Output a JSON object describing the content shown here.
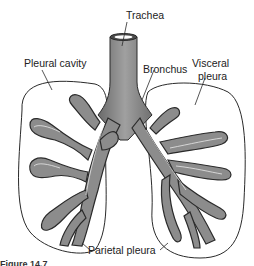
{
  "diagram": {
    "labels": {
      "trachea": "Trachea",
      "pleural_cavity": "Pleural cavity",
      "bronchus": "Bronchus",
      "visceral_pleura_line1": "Visceral",
      "visceral_pleura_line2": "pleura",
      "parietal_pleura": "Parietal pleura",
      "caption_fragment": "Figure 14.7"
    },
    "colors": {
      "airway_fill": "#8c8c8c",
      "airway_shade": "#6a6a6a",
      "outline": "#2a2a2a",
      "background": "#ffffff"
    }
  }
}
